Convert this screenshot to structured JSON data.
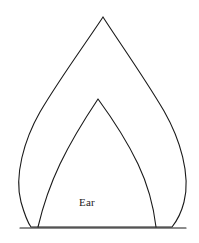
{
  "figure": {
    "background_color": "#ffffff",
    "canvas": {
      "width": 199,
      "height": 243
    }
  },
  "drawing": {
    "stroke_color": "#1a1a1a",
    "stroke_width": 1.1,
    "fill": "none",
    "outer_piece": {
      "name": "outer-ear-outline",
      "apex": {
        "x": 103,
        "y": 17
      },
      "base_left": {
        "x": 31,
        "y": 227
      },
      "base_right": {
        "x": 172,
        "y": 227
      },
      "left_extent_x": 17,
      "right_extent_x": 186,
      "path": "M 103 17 C 88 40 60 78 40 112 C 24 140 14 176 21 202 C 25 216 28 223 31 227 L 172 227 C 176 222 181 214 184 202 C 191 175 180 139 164 111 C 144 77 117 39 103 17 Z"
    },
    "inner_piece": {
      "name": "inner-ear-outline",
      "apex": {
        "x": 98,
        "y": 99
      },
      "base_left": {
        "x": 38,
        "y": 227
      },
      "base_right": {
        "x": 156,
        "y": 227
      },
      "path": "M 98 99 C 88 114 72 139 60 164 C 50 185 42 210 38 227 M 98 99 C 109 114 126 139 138 164 C 148 185 154 210 156 227"
    },
    "base_line": {
      "name": "pattern-base-line",
      "start": {
        "x": 20,
        "y": 228
      },
      "end": {
        "x": 186,
        "y": 228
      }
    }
  },
  "labels": {
    "part_name": "Ear",
    "part_name_position": {
      "x": 87,
      "y": 206
    },
    "part_name_color": "#1a1a1a"
  }
}
